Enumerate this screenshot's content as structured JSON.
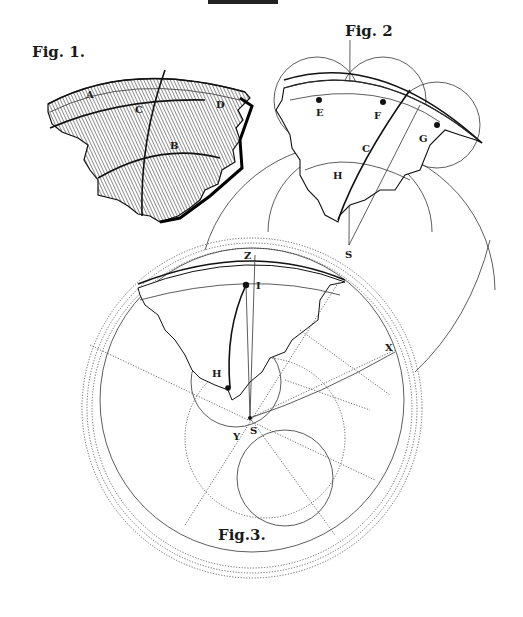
{
  "plate": {
    "header_text": "PLATE",
    "figures": [
      {
        "id": "fig1",
        "caption": "Fig. 1.",
        "labels": [
          "A",
          "C",
          "D",
          "B"
        ],
        "description": "Hatched engraving of a curved crustal fragment"
      },
      {
        "id": "fig2",
        "caption": "Fig. 2",
        "labels": [
          "E",
          "F",
          "G",
          "C",
          "H",
          "S"
        ],
        "description": "Fragment with three overlapping circles centered at E, F, G and a large arc centered at S"
      },
      {
        "id": "fig3",
        "caption": "Fig.3.",
        "labels": [
          "Z",
          "I",
          "X",
          "H",
          "S",
          "Y"
        ],
        "description": "Fragment with concentric dotted circles, construction lines radiating from S"
      }
    ]
  }
}
